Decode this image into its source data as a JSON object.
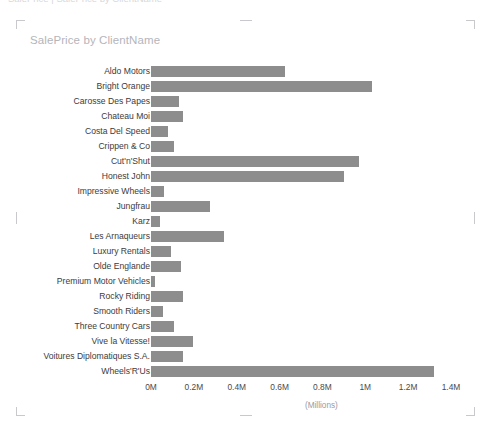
{
  "top_strip": {
    "ghost_text": "SalePrice | SalePrice by ClientName"
  },
  "chart_card": {
    "title": "SalePrice by ClientName",
    "axis_unit_label": "(Millions)",
    "bar_color": "#8d8d8d",
    "title_color": "#b5b5ba",
    "selection_handle_color": "#c9c9cd"
  },
  "chart_data": {
    "type": "bar",
    "orientation": "horizontal",
    "title": "SalePrice by ClientName",
    "xlabel": "(Millions)",
    "ylabel": "",
    "xlim": [
      0,
      1.4
    ],
    "grid": false,
    "legend": false,
    "value_unit": "Millions",
    "tick_labels": [
      "0M",
      "0.2M",
      "0.4M",
      "0.6M",
      "0.8M",
      "1M",
      "1.2M",
      "1.4M"
    ],
    "tick_values": [
      0,
      0.2,
      0.4,
      0.6,
      0.8,
      1.0,
      1.2,
      1.4
    ],
    "categories": [
      "Aldo Motors",
      "Bright Orange",
      "Carosse Des Papes",
      "Chateau Moi",
      "Costa Del Speed",
      "Crippen & Co",
      "Cut'n'Shut",
      "Honest John",
      "Impressive Wheels",
      "Jungfrau",
      "Karz",
      "Les Arnaqueurs",
      "Luxury Rentals",
      "Olde Englande",
      "Premium Motor Vehicles",
      "Rocky Riding",
      "Smooth Riders",
      "Three Country Cars",
      "Vive la Vitesse!",
      "Voitures Diplomatiques S.A.",
      "Wheels'R'Us"
    ],
    "values": [
      0.625,
      1.03,
      0.13,
      0.15,
      0.08,
      0.107,
      0.97,
      0.9,
      0.06,
      0.275,
      0.04,
      0.34,
      0.095,
      0.14,
      0.02,
      0.15,
      0.055,
      0.107,
      0.195,
      0.15,
      1.32
    ]
  }
}
